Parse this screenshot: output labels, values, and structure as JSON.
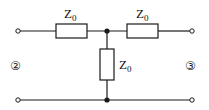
{
  "diagram": {
    "type": "T-network circuit",
    "components": [
      {
        "id": "z_left",
        "label": "Z",
        "subscript": "0",
        "orientation": "horizontal",
        "position": "top-left series"
      },
      {
        "id": "z_right",
        "label": "Z",
        "subscript": "0",
        "orientation": "horizontal",
        "position": "top-right series"
      },
      {
        "id": "z_shunt",
        "label": "Z",
        "subscript": "0",
        "orientation": "vertical",
        "position": "center shunt"
      }
    ],
    "ports": {
      "left": {
        "label": "②"
      },
      "right": {
        "label": "③"
      }
    },
    "colors": {
      "line": "#1a1a1a",
      "background": "#ffffff"
    }
  }
}
